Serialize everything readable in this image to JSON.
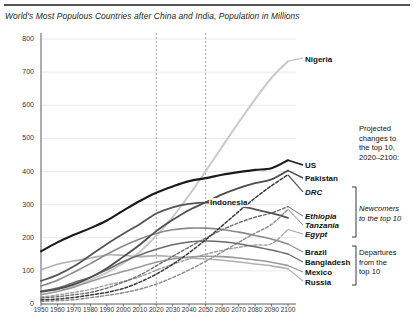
{
  "title": "World's Most Populous Countries after China and India, Population in Millions",
  "axes": {
    "y_ticks": [
      "800",
      "700",
      "600",
      "500",
      "400",
      "300",
      "200",
      "100",
      "0"
    ],
    "y_values": [
      800,
      700,
      600,
      500,
      400,
      300,
      200,
      100,
      0
    ],
    "x_ticks": [
      "1950",
      "1960",
      "1970",
      "1980",
      "1990",
      "2000",
      "2010",
      "2020",
      "2030",
      "2040",
      "2050",
      "2060",
      "2070",
      "2080",
      "2090",
      "2100"
    ],
    "x_values": [
      1950,
      1960,
      1970,
      1980,
      1990,
      2000,
      2010,
      2020,
      2030,
      2040,
      2050,
      2060,
      2070,
      2080,
      2090,
      2100
    ]
  },
  "annotations": {
    "projected_note": [
      "Projected",
      "changes to",
      "the top 10,",
      "2020–2100:"
    ],
    "newcomers": [
      "Newcomers",
      "to the top 10"
    ],
    "departures": [
      "Departures",
      "from the",
      "top 10"
    ],
    "indonesia_inline": "Indonesia"
  },
  "series_labels": {
    "nigeria": "Nigeria",
    "us": "US",
    "pakistan": "Pakistan",
    "drc": "DRC",
    "ethiopia": "Ethiopia",
    "tanzania": "Tanzania",
    "egypt": "Egypt",
    "brazil": "Brazil",
    "bangladesh": "Bangladesh",
    "mexico": "Mexico",
    "russia": "Russia"
  },
  "chart_data": {
    "type": "line",
    "title": "World's Most Populous Countries after China and India, Population in Millions",
    "xlabel": "",
    "ylabel": "Population in Millions",
    "xlim": [
      1950,
      2100
    ],
    "ylim": [
      0,
      800
    ],
    "grid": true,
    "legend": "inline-right-labels",
    "reference_lines": [
      {
        "x": 2020,
        "style": "dashed"
      },
      {
        "x": 2050,
        "style": "dashed"
      }
    ],
    "x": [
      1950,
      1960,
      1970,
      1980,
      1990,
      2000,
      2010,
      2020,
      2030,
      2040,
      2050,
      2060,
      2070,
      2080,
      2090,
      2100
    ],
    "series": [
      {
        "name": "Nigeria",
        "group": "top10",
        "style": "solid",
        "color": "#c9c9c9",
        "width": 2.0,
        "values": [
          38,
          45,
          56,
          73,
          95,
          123,
          158,
          206,
          263,
          329,
          401,
          475,
          548,
          618,
          683,
          733
        ]
      },
      {
        "name": "US",
        "group": "top10",
        "style": "solid",
        "color": "#1a1a1a",
        "width": 2.1,
        "values": [
          159,
          186,
          209,
          229,
          252,
          282,
          311,
          336,
          355,
          371,
          380,
          390,
          398,
          405,
          410,
          434
        ]
      },
      {
        "name": "Pakistan",
        "group": "top10",
        "style": "solid",
        "color": "#4d4d4d",
        "width": 1.8,
        "values": [
          37,
          45,
          59,
          80,
          108,
          143,
          179,
          220,
          254,
          284,
          307,
          331,
          350,
          365,
          376,
          403
        ]
      },
      {
        "name": "Indonesia",
        "group": "top10",
        "style": "solid",
        "color": "#555555",
        "width": 1.8,
        "values": [
          70,
          88,
          114,
          147,
          181,
          212,
          241,
          273,
          292,
          302,
          306,
          303,
          296,
          286,
          274,
          260
        ]
      },
      {
        "name": "DRC",
        "group": "newcomer",
        "style": "dashed",
        "color": "#3a3a3a",
        "width": 1.5,
        "values": [
          12,
          15,
          20,
          27,
          35,
          47,
          66,
          90,
          120,
          155,
          194,
          236,
          279,
          320,
          357,
          390
        ]
      },
      {
        "name": "Ethiopia",
        "group": "newcomer",
        "style": "dashed",
        "color": "#707070",
        "width": 1.4,
        "values": [
          18,
          22,
          28,
          35,
          48,
          66,
          87,
          115,
          144,
          172,
          199,
          224,
          245,
          262,
          275,
          294
        ]
      },
      {
        "name": "Tanzania",
        "group": "newcomer",
        "style": "dashed",
        "color": "#8a8a8a",
        "width": 1.4,
        "values": [
          8,
          10,
          13,
          19,
          26,
          34,
          45,
          60,
          80,
          103,
          129,
          157,
          186,
          214,
          240,
          286
        ]
      },
      {
        "name": "Egypt",
        "group": "newcomer",
        "style": "dashed",
        "color": "#a0a0a0",
        "width": 1.4,
        "values": [
          21,
          27,
          35,
          44,
          57,
          68,
          82,
          102,
          120,
          136,
          150,
          162,
          171,
          178,
          182,
          225
        ]
      },
      {
        "name": "Brazil",
        "group": "departure",
        "style": "solid",
        "color": "#8a8a8a",
        "width": 1.6,
        "values": [
          54,
          72,
          96,
          122,
          150,
          175,
          196,
          213,
          224,
          229,
          229,
          225,
          217,
          207,
          196,
          181
        ]
      },
      {
        "name": "Bangladesh",
        "group": "departure",
        "style": "solid",
        "color": "#6b6b6b",
        "width": 1.6,
        "values": [
          38,
          48,
          65,
          81,
          103,
          128,
          148,
          165,
          179,
          187,
          190,
          188,
          182,
          173,
          163,
          151
        ]
      },
      {
        "name": "Mexico",
        "group": "departure",
        "style": "solid",
        "color": "#9a9a9a",
        "width": 1.6,
        "values": [
          28,
          38,
          51,
          68,
          84,
          98,
          112,
          126,
          136,
          142,
          144,
          143,
          139,
          133,
          126,
          116
        ]
      },
      {
        "name": "Russia",
        "group": "departure",
        "style": "solid",
        "color": "#b0b0b0",
        "width": 1.6,
        "values": [
          103,
          120,
          130,
          139,
          148,
          147,
          143,
          146,
          143,
          139,
          136,
          132,
          127,
          121,
          115,
          106
        ]
      }
    ]
  }
}
